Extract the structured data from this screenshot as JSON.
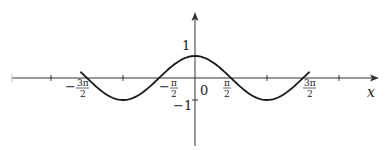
{
  "chart_data": {
    "type": "line",
    "title": "",
    "function": "cos(x)",
    "xlabel": "x",
    "ylabel": "",
    "xlim": [
      -6.7,
      5.8
    ],
    "ylim": [
      -3.0,
      3.0
    ],
    "grid": false,
    "legend": null,
    "series": [
      {
        "name": "y = cos x",
        "x_range": [
          -5.0,
          5.0
        ],
        "color": "#1a1a1a"
      }
    ],
    "x_tick_positions_pi": [
      -2,
      -1.5,
      -1,
      -0.5,
      0,
      0.5,
      1,
      1.5,
      2
    ],
    "x_tick_labels": [
      {
        "pos_pi": -1.5,
        "num": "3π",
        "den": "2",
        "sign": "−"
      },
      {
        "pos_pi": -0.5,
        "num": "π",
        "den": "2",
        "sign": "−"
      },
      {
        "pos_pi": 0,
        "text": "0"
      },
      {
        "pos_pi": 0.5,
        "num": "π",
        "den": "2",
        "sign": ""
      },
      {
        "pos_pi": 1.5,
        "num": "3π",
        "den": "2",
        "sign": ""
      }
    ],
    "y_tick_labels": [
      {
        "value": 1,
        "text": "1"
      },
      {
        "value": -1,
        "text": "−1"
      }
    ]
  },
  "labels": {
    "x_axis": "x",
    "origin": "0",
    "y_one": "1",
    "y_minus_one": "−1",
    "neg_three_pi_over_two": {
      "sign": "−",
      "num": "3π",
      "den": "2"
    },
    "neg_pi_over_two": {
      "sign": "−",
      "num": "π",
      "den": "2"
    },
    "pi_over_two": {
      "num": "π",
      "den": "2"
    },
    "three_pi_over_two": {
      "num": "3π",
      "den": "2"
    }
  },
  "colors": {
    "curve": "#1a1a1a",
    "axis": "#333333"
  }
}
